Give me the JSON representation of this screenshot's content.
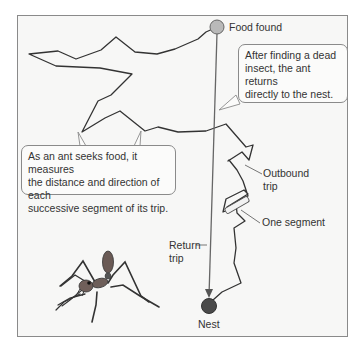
{
  "diagram": {
    "labels": {
      "food_found": "Food found",
      "nest": "Nest",
      "outbound_line1": "Outbound",
      "outbound_line2": "trip",
      "one_segment": "One segment",
      "return_line1": "Return",
      "return_line2": "trip"
    },
    "callouts": {
      "return_explanation": {
        "line1": "After finding a dead",
        "line2": "insect, the ant returns",
        "line3": "directly to the nest."
      },
      "seek_explanation": {
        "line1": "As an ant seeks food, it measures",
        "line2": "the distance and direction of each",
        "line3": "successive segment of its trip."
      }
    },
    "colors": {
      "panel_bg": "#f7f7f6",
      "path": "#333333",
      "food_circle": "#b9b9b9",
      "nest_circle": "#4a4a4a",
      "return_line": "#666666"
    },
    "illustration": "ant"
  }
}
